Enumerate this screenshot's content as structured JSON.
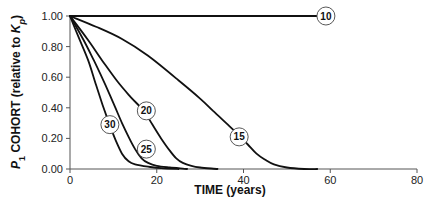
{
  "chart_data": {
    "type": "line",
    "title": "",
    "xlabel": "TIME (years)",
    "ylabel": "P1 COHORT (relative to Kp)",
    "ylabel_parts": {
      "p": "P",
      "p_sub": "1",
      "mid": " COHORT (relative to ",
      "k": "K",
      "k_sub": "p",
      "end": ")"
    },
    "xlim": [
      0,
      80
    ],
    "ylim": [
      0,
      1.0
    ],
    "xticks": [
      "0",
      "20",
      "40",
      "60",
      "80"
    ],
    "yticks": [
      "0.00",
      "0.20",
      "0.40",
      "0.60",
      "0.80",
      "1.00"
    ],
    "grid": false,
    "legend": "inline circled labels",
    "series": [
      {
        "name": "10",
        "label_pos": [
          59.0,
          1.0
        ],
        "x": [
          0,
          57
        ],
        "y": [
          1.0,
          1.0
        ]
      },
      {
        "name": "15",
        "label_pos": [
          39.0,
          0.21
        ],
        "x": [
          0,
          6,
          12,
          18,
          25,
          30,
          33,
          36,
          39,
          41,
          43,
          45,
          47,
          50,
          54,
          57
        ],
        "y": [
          1.0,
          0.93,
          0.85,
          0.74,
          0.58,
          0.46,
          0.38,
          0.3,
          0.22,
          0.16,
          0.1,
          0.06,
          0.03,
          0.01,
          0.0,
          0.0
        ]
      },
      {
        "name": "20",
        "label_pos": [
          17.6,
          0.38
        ],
        "x": [
          0,
          4,
          7.4,
          11,
          14,
          17,
          19,
          21,
          23,
          24.5,
          26,
          28,
          30,
          34
        ],
        "y": [
          1.0,
          0.85,
          0.71,
          0.57,
          0.47,
          0.38,
          0.29,
          0.2,
          0.12,
          0.07,
          0.04,
          0.02,
          0.01,
          0.0
        ]
      },
      {
        "name": "25",
        "label_pos": [
          17.6,
          0.13
        ],
        "x": [
          0,
          3,
          5.5,
          8,
          10,
          12,
          13.5,
          15,
          16.5,
          18,
          20,
          23,
          27
        ],
        "y": [
          1.0,
          0.85,
          0.71,
          0.56,
          0.43,
          0.3,
          0.21,
          0.13,
          0.07,
          0.04,
          0.02,
          0.01,
          0.0
        ]
      },
      {
        "name": "30",
        "label_pos": [
          9.2,
          0.29
        ],
        "x": [
          0,
          2,
          4.2,
          6,
          7.5,
          9,
          10.5,
          12,
          13.5,
          15,
          18,
          21,
          25
        ],
        "y": [
          1.0,
          0.86,
          0.71,
          0.55,
          0.42,
          0.3,
          0.19,
          0.1,
          0.05,
          0.03,
          0.015,
          0.005,
          0.0
        ]
      }
    ]
  },
  "layout": {
    "plot": {
      "x0": 70,
      "x1": 417,
      "y0": 169,
      "y1": 16
    }
  }
}
